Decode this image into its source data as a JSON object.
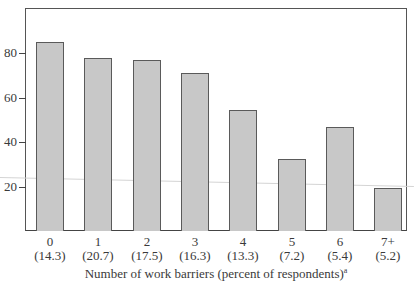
{
  "chart_data": {
    "type": "bar",
    "title": "",
    "xlabel": "Number of work barriers (percent of respondents)",
    "xlabel_superscript": "a",
    "ylabel": "",
    "ylim": [
      0,
      100
    ],
    "yticks": [
      20,
      40,
      60,
      80
    ],
    "categories": [
      "0",
      "1",
      "2",
      "3",
      "4",
      "5",
      "6",
      "7+"
    ],
    "category_percents": [
      "(14.3)",
      "(20.7)",
      "(17.5)",
      "(16.3)",
      "(13.3)",
      "(7.2)",
      "(5.4)",
      "(5.2)"
    ],
    "values": [
      85,
      78,
      77,
      71,
      54.5,
      32.5,
      47,
      19.5
    ],
    "grid": false,
    "legend": null,
    "colors": {
      "bar_fill": "#c8c8c8",
      "bar_edge": "#5a5a5a",
      "axis": "#444444"
    }
  }
}
